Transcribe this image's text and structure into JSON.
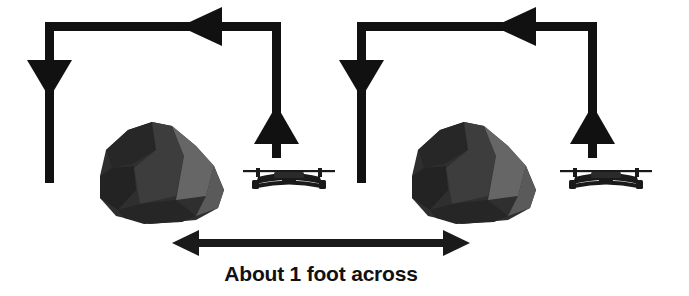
{
  "figure": {
    "background_color": "#ffffff",
    "stroke_color": "#111111",
    "caption": "About 1 foot across",
    "caption_color": "#111111"
  },
  "measurement": {
    "label": "About 1 foot across",
    "value": "1",
    "unit": "foot",
    "qualifier": "About",
    "dimension": "across",
    "arrow_style": "double-headed",
    "x_start": 172,
    "x_end": 470,
    "y": 243
  },
  "rocks": [
    {
      "name": "rock-left",
      "x": 98,
      "y": 124,
      "width": 128,
      "height": 100,
      "dark_facet_color": "#2e2e2e",
      "mid_facet_color": "#3f3f3f",
      "light_facet_color": "#6a6a6a"
    },
    {
      "name": "rock-right",
      "x": 410,
      "y": 124,
      "width": 128,
      "height": 100,
      "dark_facet_color": "#2e2e2e",
      "mid_facet_color": "#3f3f3f",
      "light_facet_color": "#6a6a6a"
    }
  ],
  "drones": [
    {
      "name": "drone-left",
      "x": 243,
      "y": 162,
      "width": 92,
      "height": 30,
      "color": "#1a1a1a",
      "view": "front"
    },
    {
      "name": "drone-right",
      "x": 560,
      "y": 162,
      "width": 92,
      "height": 30,
      "color": "#1a1a1a",
      "view": "front"
    }
  ],
  "flight_paths": [
    {
      "name": "flight-path-left",
      "left_x": 45,
      "right_x": 281,
      "top_y": 26,
      "descend_end_y": 183,
      "ascend_end_y": 158,
      "segments": [
        {
          "name": "top-bar",
          "direction": "left",
          "arrowhead": "left"
        },
        {
          "name": "descend-shaft",
          "direction": "down",
          "arrowhead": "down"
        },
        {
          "name": "ascend-shaft",
          "direction": "up",
          "arrowhead": "up"
        }
      ]
    },
    {
      "name": "flight-path-right",
      "left_x": 357,
      "right_x": 597,
      "top_y": 26,
      "descend_end_y": 183,
      "ascend_end_y": 158,
      "segments": [
        {
          "name": "top-bar",
          "direction": "left",
          "arrowhead": "left"
        },
        {
          "name": "descend-shaft",
          "direction": "down",
          "arrowhead": "down"
        },
        {
          "name": "ascend-shaft",
          "direction": "up",
          "arrowhead": "up"
        }
      ]
    }
  ]
}
